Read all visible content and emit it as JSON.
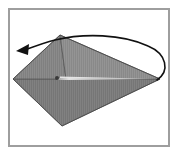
{
  "figure": {
    "title": "Origami diagram step",
    "caption": "Kite-shaped folded paper with a curved fold-over arrow",
    "background_color": "#ffffff",
    "frame": {
      "border_color": "#9e9e9e",
      "border_width_px": 2,
      "x": 8,
      "y": 8,
      "width": 162,
      "height": 139
    },
    "paper": {
      "name": "folded-paper-kite",
      "fill_color": "#808080",
      "fill_color_light": "#8d8d8d",
      "fill_color_dark": "#6f6f6f",
      "edge_color": "#4a4a4a",
      "texture": "fine vertical stripes",
      "vertices": "13,79 60,35 160,79 62,126",
      "upper_right_panel_points": "60,35 160,79 66,79",
      "upper_right_panel_fill": "#8a8a8a",
      "lower_panel_points": "13,79 66,79 160,79 62,126",
      "lower_panel_fill": "#777777"
    },
    "crease": {
      "name": "center-crease-line",
      "color": "#e8e8e8",
      "x1": 58,
      "y1": 78,
      "x2": 158,
      "y2": 79,
      "dot_color": "#3a3a3a",
      "dot_x": 57,
      "dot_y": 78,
      "dot_r": 2
    },
    "arrow": {
      "name": "fold-over-arrow",
      "color": "#111111",
      "stroke_width": 1.6,
      "direction": "right-to-left fold over the top",
      "path": "M 157 80 C 169 72 168 55 150 47 C 124 35 86 33 56 40 C 44 43 33 46 24 50",
      "head_points": "18,50 28,45 27,55"
    }
  }
}
